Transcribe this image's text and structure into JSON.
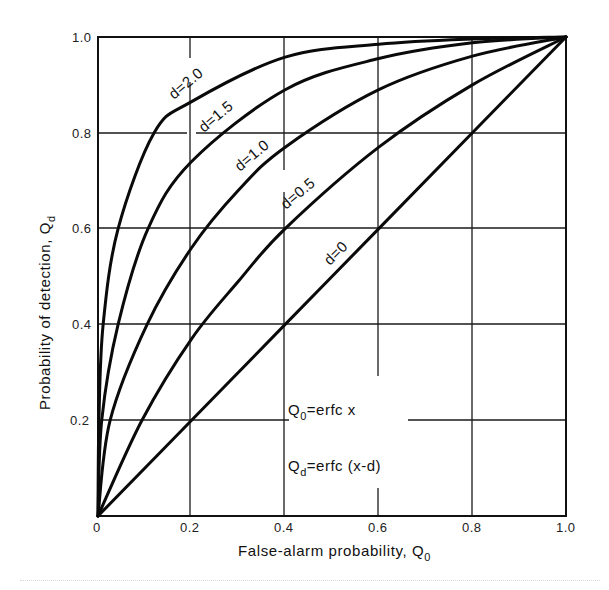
{
  "chart_data": {
    "type": "line",
    "title": "",
    "xlabel": "False-alarm probability, Q",
    "xlabel_sub": "0",
    "ylabel": "Probability of detection, Q",
    "ylabel_sub": "d",
    "xlim": [
      0,
      1.0
    ],
    "ylim": [
      0,
      1.0
    ],
    "grid": true,
    "legend": "inline labels on curves",
    "x_ticks": [
      "0",
      "0.2",
      "0.4",
      "0.6",
      "0.8",
      "1.0"
    ],
    "y_ticks": [
      "0.2",
      "0.4",
      "0.6",
      "0.8",
      "1.0"
    ],
    "annotations": [
      {
        "main": "Q",
        "sub": "0",
        "rest": "=erfc  x"
      },
      {
        "main": "Q",
        "sub": "d",
        "rest": "=erfc (x-d)"
      }
    ],
    "series": [
      {
        "name": "d=2.0",
        "label": "d=2.0",
        "x": [
          0,
          0.002,
          0.011,
          0.043,
          0.12,
          0.2,
          0.4,
          0.6,
          0.8,
          1.0
        ],
        "y": [
          0,
          0.2,
          0.4,
          0.6,
          0.8,
          0.865,
          0.958,
          0.985,
          0.996,
          1.0
        ]
      },
      {
        "name": "d=1.5",
        "label": "d=1.5",
        "x": [
          0,
          0.008,
          0.043,
          0.107,
          0.2,
          0.4,
          0.6,
          0.8,
          1.0
        ],
        "y": [
          0,
          0.2,
          0.4,
          0.6,
          0.74,
          0.89,
          0.955,
          0.988,
          1.0
        ]
      },
      {
        "name": "d=1.0",
        "label": "d=1.0",
        "x": [
          0,
          0.026,
          0.105,
          0.2,
          0.3,
          0.4,
          0.6,
          0.8,
          1.0
        ],
        "y": [
          0,
          0.2,
          0.4,
          0.56,
          0.68,
          0.77,
          0.89,
          0.96,
          1.0
        ]
      },
      {
        "name": "d=0.5",
        "label": "d=0.5",
        "x": [
          0,
          0.094,
          0.2,
          0.3,
          0.4,
          0.6,
          0.8,
          1.0
        ],
        "y": [
          0,
          0.2,
          0.37,
          0.49,
          0.6,
          0.77,
          0.9,
          1.0
        ]
      },
      {
        "name": "d=0",
        "label": "d=0",
        "x": [
          0,
          0.2,
          0.4,
          0.6,
          0.8,
          1.0
        ],
        "y": [
          0,
          0.2,
          0.4,
          0.6,
          0.8,
          1.0
        ]
      }
    ]
  }
}
